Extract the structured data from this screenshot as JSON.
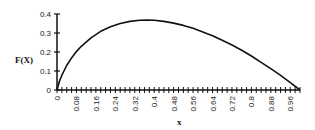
{
  "chart_data": {
    "type": "line",
    "title": "",
    "xlabel": "x",
    "ylabel": "F(X)",
    "xlim": [
      0,
      1
    ],
    "ylim": [
      0,
      0.4
    ],
    "grid": false,
    "legend": null,
    "y_ticks": [
      0,
      0.1,
      0.2,
      0.3,
      0.4
    ],
    "y_tick_labels": [
      "0",
      "0.1",
      "0.2",
      "0.3",
      "0.4"
    ],
    "x_ticks": [
      0,
      0.08,
      0.16,
      0.24,
      0.32,
      0.4,
      0.48,
      0.56,
      0.64,
      0.72,
      0.8,
      0.88,
      0.96
    ],
    "x_tick_labels": [
      "0",
      "0.08",
      "0.16",
      "0.24",
      "0.32",
      "0.4",
      "0.48",
      "0.56",
      "0.64",
      "0.72",
      "0.8",
      "0.88",
      "0.96"
    ],
    "x_minor_tick_step": 0.02,
    "series": [
      {
        "name": "F(X)",
        "color": "#111111",
        "x": [
          0,
          0.01,
          0.02,
          0.04,
          0.06,
          0.08,
          0.1,
          0.14,
          0.18,
          0.22,
          0.26,
          0.3,
          0.34,
          0.37,
          0.4,
          0.44,
          0.48,
          0.52,
          0.56,
          0.6,
          0.64,
          0.68,
          0.72,
          0.76,
          0.8,
          0.84,
          0.88,
          0.92,
          0.96,
          1.0
        ],
        "y": [
          0,
          0.046,
          0.078,
          0.129,
          0.169,
          0.202,
          0.23,
          0.275,
          0.309,
          0.333,
          0.35,
          0.361,
          0.367,
          0.368,
          0.367,
          0.361,
          0.352,
          0.34,
          0.325,
          0.306,
          0.286,
          0.262,
          0.237,
          0.209,
          0.179,
          0.146,
          0.112,
          0.077,
          0.039,
          0
        ]
      }
    ]
  },
  "labels": {
    "ylabel": "F(X)",
    "xlabel": "x"
  }
}
